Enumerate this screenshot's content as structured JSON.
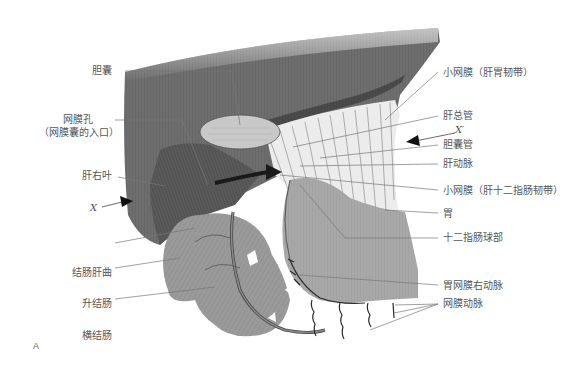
{
  "figure": {
    "panel_label": "A",
    "colors": {
      "liver": "#6e6e6e",
      "liver_dark": "#4e4e4e",
      "omentum": "#e8e8e8",
      "stomach": "#a9a9a9",
      "colon": "#999999",
      "gallbladder": "#c8c8c8",
      "leader_line": "#777777"
    },
    "labels_left": [
      {
        "id": "gallbladder",
        "text": "胆囊"
      },
      {
        "id": "epiploic-foramen",
        "text": "网膜孔",
        "text2": "（网膜囊的入口）"
      },
      {
        "id": "right-lobe-liver",
        "text": "肝右叶"
      },
      {
        "id": "x-marker",
        "text": "X"
      },
      {
        "id": "hepatic-flexure",
        "text": "结肠肝曲"
      },
      {
        "id": "ascending-colon",
        "text": "升结肠"
      },
      {
        "id": "transverse-colon",
        "text": "横结肠"
      }
    ],
    "labels_right": [
      {
        "id": "hepatogastric-ligament",
        "text": "小网膜（肝胃韧带）"
      },
      {
        "id": "common-hepatic-duct",
        "text": "肝总管"
      },
      {
        "id": "x-prime-marker",
        "text": "X′"
      },
      {
        "id": "cystic-duct",
        "text": "胆囊管"
      },
      {
        "id": "hepatic-artery",
        "text": "肝动脉"
      },
      {
        "id": "hepatoduodenal-ligament",
        "text": "小网膜（肝十二指肠韧带）"
      },
      {
        "id": "stomach",
        "text": "胃"
      },
      {
        "id": "duodenal-bulb",
        "text": "十二指肠球部"
      },
      {
        "id": "right-gastroepiploic-artery",
        "text": "胃网膜右动脉"
      },
      {
        "id": "epiploic-arteries",
        "text": "网膜动脉"
      }
    ]
  }
}
